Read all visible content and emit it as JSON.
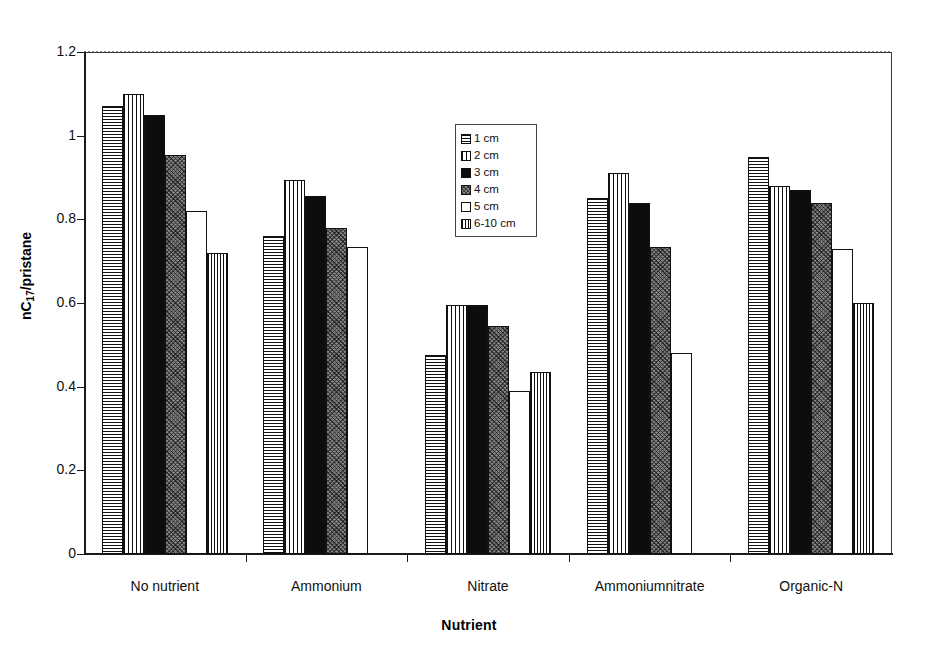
{
  "chart_data": {
    "type": "bar",
    "title": "",
    "xlabel": "Nutrient",
    "ylabel": "nC17/pristane",
    "ylabel_base": "nC",
    "ylabel_sub": "17",
    "ylabel_tail": "/pristane",
    "ylim": [
      0,
      1.2
    ],
    "yticks": [
      0,
      0.2,
      0.4,
      0.6,
      0.8,
      1,
      1.2
    ],
    "ytick_labels": [
      "0",
      "0.2",
      "0.4",
      "0.6",
      "0.8",
      "1",
      "1.2"
    ],
    "grid": false,
    "legend_position": "inside-top-center",
    "categories": [
      "No nutrient",
      "Ammonium",
      "Nitrate",
      "Ammoniumnitrate",
      "Organic-N"
    ],
    "series": [
      {
        "name": "1 cm",
        "pattern": "horizontal-lines",
        "values": [
          1.07,
          0.76,
          0.475,
          0.85,
          0.95
        ]
      },
      {
        "name": "2 cm",
        "pattern": "vertical-lines",
        "values": [
          1.1,
          0.895,
          0.595,
          0.91,
          0.88
        ]
      },
      {
        "name": "3 cm",
        "pattern": "solid-black",
        "values": [
          1.05,
          0.855,
          0.595,
          0.84,
          0.87
        ]
      },
      {
        "name": "4 cm",
        "pattern": "dark-speckle",
        "values": [
          0.955,
          0.78,
          0.545,
          0.735,
          0.84
        ]
      },
      {
        "name": "5 cm",
        "pattern": "empty-white",
        "values": [
          0.82,
          0.735,
          0.39,
          0.48,
          0.73
        ]
      },
      {
        "name": "6-10 cm",
        "pattern": "cross-hatch",
        "values": [
          0.72,
          0,
          0.435,
          0,
          0.6
        ]
      }
    ]
  },
  "legend": {
    "items": [
      {
        "label": "1 cm"
      },
      {
        "label": "2 cm"
      },
      {
        "label": "3 cm"
      },
      {
        "label": "4 cm"
      },
      {
        "label": "5 cm"
      },
      {
        "label": "6-10 cm"
      }
    ]
  },
  "axes": {
    "x_title": "Nutrient",
    "y_title_base": "nC",
    "y_title_sub": "17",
    "y_title_tail": "/pristane"
  }
}
